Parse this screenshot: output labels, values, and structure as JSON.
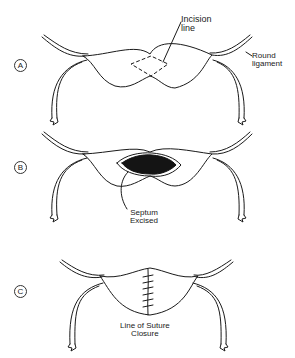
{
  "figure": {
    "panels": [
      {
        "letter": "A",
        "labels": {
          "incision": "Incision\nline",
          "round_ligament": "Round\nligament"
        }
      },
      {
        "letter": "B",
        "labels": {
          "septum": "Septum\nExcised"
        }
      },
      {
        "letter": "C",
        "labels": {
          "suture": "Line of Suture\nClosure"
        }
      }
    ],
    "colors": {
      "line": "#1a1a1a",
      "septum_fill": "#141414",
      "background": "#ffffff"
    }
  }
}
